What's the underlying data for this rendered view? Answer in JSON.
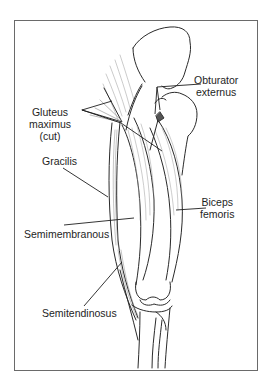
{
  "figure": {
    "type": "anatomical illustration",
    "labels": [
      {
        "id": "obturator-externus",
        "lines": [
          "Obturator",
          "externus"
        ]
      },
      {
        "id": "gluteus-maximus",
        "lines": [
          "Gluteus",
          "maximus",
          "(cut)"
        ]
      },
      {
        "id": "gracilis",
        "lines": [
          "Gracilis"
        ]
      },
      {
        "id": "biceps-femoris",
        "lines": [
          "Biceps",
          "femoris"
        ]
      },
      {
        "id": "semimembranous",
        "lines": [
          "Semimembranous"
        ]
      },
      {
        "id": "semitendinosus",
        "lines": [
          "Semitendinosus"
        ]
      }
    ],
    "colors": {
      "line": "#1e1e1e",
      "frame": "#6a6a6a",
      "hatch": "#9a9a9a",
      "background": "#ffffff"
    }
  }
}
